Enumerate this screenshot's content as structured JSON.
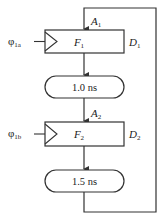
{
  "diagram": {
    "stages": [
      {
        "register": "F",
        "register_sub": "1",
        "clock": "φ",
        "clock_sub": "1a",
        "input_label": "A",
        "input_sub": "1",
        "output_label": "D",
        "output_sub": "1",
        "delay": "1.0 ns"
      },
      {
        "register": "F",
        "register_sub": "2",
        "clock": "φ",
        "clock_sub": "1b",
        "input_label": "A",
        "input_sub": "2",
        "output_label": "D",
        "output_sub": "2",
        "delay": "1.5 ns"
      }
    ],
    "colors": {
      "line": "#333333",
      "background": "#ffffff"
    }
  }
}
